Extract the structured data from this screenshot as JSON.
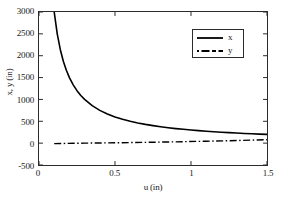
{
  "chart_data": {
    "type": "line",
    "title": "",
    "xlabel": "u (in)",
    "ylabel": "x, y (in)",
    "xlim": [
      0,
      1.5
    ],
    "ylim": [
      -500,
      3000
    ],
    "xticks": [
      "0",
      "0.5",
      "1",
      "1.5"
    ],
    "xtick_values": [
      0,
      0.5,
      1,
      1.5
    ],
    "yticks": [
      "-500",
      "0",
      "500",
      "1000",
      "1500",
      "2000",
      "2500",
      "3000"
    ],
    "ytick_values": [
      -500,
      0,
      500,
      1000,
      1500,
      2000,
      2500,
      3000
    ],
    "grid": false,
    "legend_position": "upper right",
    "series": [
      {
        "name": "x",
        "style": "solid",
        "color": "#000000",
        "x": [
          0.1,
          0.12,
          0.14,
          0.16,
          0.18,
          0.2,
          0.225,
          0.25,
          0.275,
          0.3,
          0.35,
          0.4,
          0.45,
          0.5,
          0.55,
          0.6,
          0.65,
          0.7,
          0.75,
          0.8,
          0.85,
          0.9,
          0.95,
          1.0,
          1.05,
          1.1,
          1.15,
          1.2,
          1.25,
          1.3,
          1.35,
          1.4,
          1.45,
          1.5
        ],
        "values": [
          3000,
          2500,
          2143,
          1875,
          1667,
          1500,
          1333,
          1200,
          1091,
          1000,
          857,
          750,
          667,
          600,
          545,
          500,
          462,
          429,
          400,
          375,
          353,
          333,
          316,
          300,
          286,
          273,
          261,
          250,
          240,
          231,
          222,
          214,
          207,
          200
        ]
      },
      {
        "name": "y",
        "style": "dashdot",
        "color": "#000000",
        "x": [
          0.1,
          0.3,
          0.5,
          0.7,
          0.9,
          1.1,
          1.3,
          1.5
        ],
        "values": [
          -10,
          0,
          8,
          18,
          30,
          44,
          60,
          78
        ]
      }
    ],
    "legend": [
      {
        "label": "x",
        "style": "solid"
      },
      {
        "label": "y",
        "style": "dashdot"
      }
    ]
  }
}
